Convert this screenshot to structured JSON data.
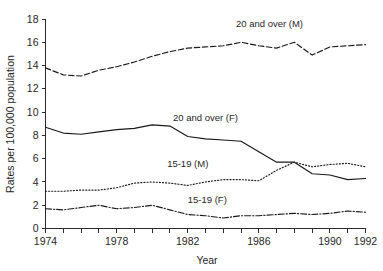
{
  "chart_data": {
    "type": "line",
    "title": "",
    "xlabel": "Year",
    "ylabel": "Rates per 100,000 population",
    "xlim": [
      1974,
      1992
    ],
    "ylim": [
      0,
      18
    ],
    "grid": false,
    "legend_position": "inline-annotations",
    "x": [
      1974,
      1975,
      1976,
      1977,
      1978,
      1979,
      1980,
      1981,
      1982,
      1983,
      1984,
      1985,
      1986,
      1987,
      1988,
      1989,
      1990,
      1991,
      1992
    ],
    "x_tick_labels": [
      "1974",
      "1978",
      "1982",
      "1986",
      "1990",
      "1992"
    ],
    "x_tick_values": [
      1974,
      1978,
      1982,
      1986,
      1990,
      1992
    ],
    "y_tick_labels": [
      "0",
      "2",
      "4",
      "6",
      "8",
      "10",
      "12",
      "14",
      "16",
      "18"
    ],
    "y_tick_values": [
      0,
      2,
      4,
      6,
      8,
      10,
      12,
      14,
      16,
      18
    ],
    "series": [
      {
        "name": "20 and over (M)",
        "style": "dashed",
        "label_x": 1986.6,
        "label_y": 17.3,
        "values": [
          13.8,
          13.2,
          13.1,
          13.6,
          13.9,
          14.3,
          14.8,
          15.2,
          15.5,
          15.6,
          15.7,
          16.0,
          15.7,
          15.5,
          16.0,
          14.9,
          15.6,
          15.7,
          15.8
        ]
      },
      {
        "name": "20 and over (F)",
        "style": "solid",
        "label_x": 1983.0,
        "label_y": 9.2,
        "values": [
          8.7,
          8.2,
          8.1,
          8.3,
          8.5,
          8.6,
          8.9,
          8.8,
          7.9,
          7.7,
          7.6,
          7.5,
          6.6,
          5.7,
          5.7,
          4.7,
          4.6,
          4.2,
          4.3
        ]
      },
      {
        "name": "15-19 (M)",
        "style": "dotted",
        "label_x": 1982.0,
        "label_y": 5.3,
        "values": [
          3.2,
          3.2,
          3.3,
          3.3,
          3.5,
          3.9,
          4.0,
          3.9,
          3.7,
          4.0,
          4.2,
          4.2,
          4.1,
          5.0,
          5.7,
          5.3,
          5.5,
          5.6,
          5.3
        ]
      },
      {
        "name": "15-19 (F)",
        "style": "dashdot",
        "label_x": 1983.1,
        "label_y": 2.2,
        "values": [
          1.7,
          1.6,
          1.8,
          2.0,
          1.7,
          1.8,
          2.0,
          1.6,
          1.2,
          1.1,
          0.9,
          1.1,
          1.1,
          1.2,
          1.3,
          1.2,
          1.3,
          1.5,
          1.4
        ]
      }
    ]
  }
}
